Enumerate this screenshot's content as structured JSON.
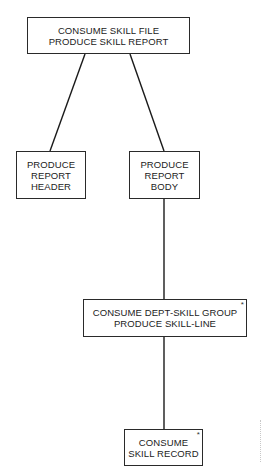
{
  "diagram": {
    "type": "tree",
    "nodes": {
      "root": {
        "lines": [
          "CONSUME SKILL FILE",
          "PRODUCE SKILL REPORT"
        ],
        "iteration_marker": ""
      },
      "head": {
        "lines": [
          "PRODUCE",
          "REPORT",
          "HEADER"
        ],
        "iteration_marker": ""
      },
      "body": {
        "lines": [
          "PRODUCE",
          "REPORT",
          "BODY"
        ],
        "iteration_marker": ""
      },
      "group": {
        "lines": [
          "CONSUME DEPT-SKILL GROUP",
          "PRODUCE SKILL-LINE"
        ],
        "iteration_marker": "*"
      },
      "rec": {
        "lines": [
          "CONSUME",
          "SKILL RECORD"
        ],
        "iteration_marker": "*"
      }
    },
    "edges": [
      {
        "from": "root",
        "to": "head"
      },
      {
        "from": "root",
        "to": "body"
      },
      {
        "from": "body",
        "to": "group"
      },
      {
        "from": "group",
        "to": "rec"
      }
    ]
  }
}
